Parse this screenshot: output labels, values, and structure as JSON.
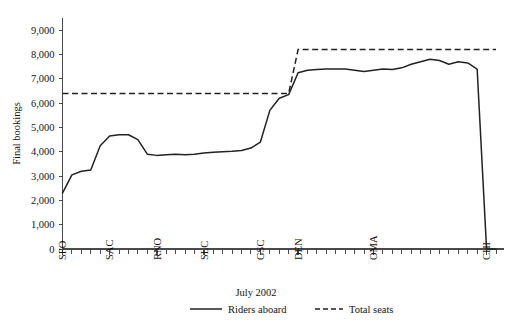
{
  "chart_data": {
    "type": "line",
    "title": "",
    "xlabel": "July 2002",
    "ylabel": "Final bookings",
    "ylim": [
      0,
      9500
    ],
    "grid": false,
    "legend_position": "bottom",
    "ytick_labels": [
      "0",
      "1,000",
      "2,000",
      "3,000",
      "4,000",
      "5,000",
      "6,000",
      "7,000",
      "8,000",
      "9,000"
    ],
    "ytick_values": [
      0,
      1000,
      2000,
      3000,
      4000,
      5000,
      6000,
      7000,
      8000,
      9000
    ],
    "xtick_labels": [
      "SFO",
      "SAC",
      "RNO",
      "SLC",
      "GSC",
      "DEN",
      "OMA",
      "CHI"
    ],
    "xtick_positions": [
      0,
      5,
      10,
      15,
      21,
      25,
      33,
      45
    ],
    "x_total_ticks": 47,
    "x": [
      0,
      1,
      2,
      3,
      4,
      5,
      6,
      7,
      8,
      9,
      10,
      11,
      12,
      13,
      14,
      15,
      16,
      17,
      18,
      19,
      20,
      21,
      22,
      23,
      24,
      25,
      26,
      27,
      28,
      29,
      30,
      31,
      32,
      33,
      34,
      35,
      36,
      37,
      38,
      39,
      40,
      41,
      42,
      43,
      44,
      45,
      46
    ],
    "series": [
      {
        "name": "Riders aboard",
        "style": "solid",
        "values": [
          2300,
          3050,
          3200,
          3250,
          4250,
          4650,
          4700,
          4700,
          4500,
          3900,
          3850,
          3880,
          3900,
          3880,
          3900,
          3950,
          3980,
          4000,
          4020,
          4050,
          4150,
          4400,
          5700,
          6200,
          6350,
          7250,
          7350,
          7380,
          7400,
          7400,
          7400,
          7350,
          7300,
          7350,
          7400,
          7380,
          7450,
          7600,
          7700,
          7800,
          7750,
          7600,
          7700,
          7650,
          7400,
          0,
          0
        ]
      },
      {
        "name": "Total seats",
        "style": "dashed",
        "values": [
          6400,
          6400,
          6400,
          6400,
          6400,
          6400,
          6400,
          6400,
          6400,
          6400,
          6400,
          6400,
          6400,
          6400,
          6400,
          6400,
          6400,
          6400,
          6400,
          6400,
          6400,
          6400,
          6400,
          6400,
          6400,
          8200,
          8200,
          8200,
          8200,
          8200,
          8200,
          8200,
          8200,
          8200,
          8200,
          8200,
          8200,
          8200,
          8200,
          8200,
          8200,
          8200,
          8200,
          8200,
          8200,
          8200,
          8200
        ]
      }
    ]
  },
  "legend": {
    "title": "July 2002",
    "items": [
      {
        "label": "Riders aboard",
        "style": "solid"
      },
      {
        "label": "Total seats",
        "style": "dashed"
      }
    ]
  },
  "colors": {
    "line": "#222222",
    "axis": "#4a4a4a",
    "background": "#ffffff",
    "text": "#141414"
  }
}
